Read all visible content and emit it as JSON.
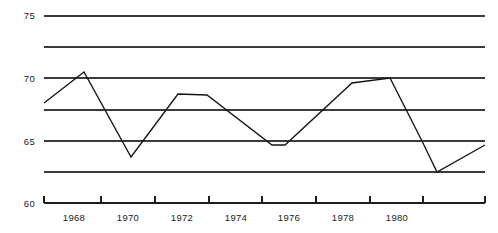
{
  "chart_data": {
    "type": "line",
    "title": "",
    "subtitle": "",
    "xlabel": "",
    "ylabel": "",
    "xlim": [
      1966.6,
      1974.8
    ],
    "ylim": [
      60,
      76
    ],
    "grid": true,
    "legend": null,
    "y_axis": {
      "labels": [
        "75",
        "70",
        "65",
        "60"
      ],
      "label_values": [
        75,
        70,
        65,
        60
      ],
      "gridline_values": [
        75,
        72.5,
        70,
        67.5,
        65,
        62.5
      ],
      "axis_base_value": 60
    },
    "x_axis": {
      "tick_labels": [
        "1968",
        "1970",
        "1972",
        "1974",
        "1976",
        "1978",
        "1980"
      ],
      "tick_label_values": [
        1968,
        1970,
        1972,
        1974,
        1976,
        1978,
        1980
      ],
      "tick_mark_values": [
        1967,
        1969,
        1971,
        1973,
        1975,
        1977,
        1979
      ],
      "range_start": 1966.6,
      "range_end": 1974.8
    },
    "series": [
      {
        "name": "series-1",
        "x": [
          1966.6,
          1967.35,
          1968.25,
          1969.15,
          1970.2,
          1970.9,
          1971.45,
          1972.15,
          1972.8,
          1973.4,
          1974.1,
          1974.8
        ],
        "values": [
          67.8,
          70.5,
          63.9,
          68.6,
          64.6,
          64.6,
          70.0,
          69.7,
          70.0,
          62.5,
          62.5,
          64.6
        ]
      }
    ],
    "points": [
      {
        "year": 1966.6,
        "value": 67.8
      },
      {
        "year": 1967.35,
        "value": 70.5
      },
      {
        "year": 1968.25,
        "value": 63.9
      },
      {
        "year": 1969.15,
        "value": 68.6
      },
      {
        "year": 1970.2,
        "value": 64.6
      },
      {
        "year": 1970.9,
        "value": 64.6
      },
      {
        "year": 1971.45,
        "value": 70.0
      },
      {
        "year": 1972.15,
        "value": 69.7
      },
      {
        "year": 1972.8,
        "value": 70.0
      },
      {
        "year": 1973.4,
        "value": 62.5
      },
      {
        "year": 1974.1,
        "value": 62.5
      },
      {
        "year": 1974.8,
        "value": 64.6
      }
    ],
    "pixel_polyline": [
      [
        44,
        103
      ],
      [
        84,
        72
      ],
      [
        131,
        157
      ],
      [
        178,
        94
      ],
      [
        207,
        95
      ],
      [
        272,
        145
      ],
      [
        285,
        145
      ],
      [
        352,
        83
      ],
      [
        390,
        78
      ],
      [
        422,
        141
      ],
      [
        437,
        172
      ],
      [
        485,
        145
      ]
    ],
    "geometry": {
      "plot_left": 44,
      "plot_right": 485,
      "plot_top": 16,
      "plot_bottom": 203,
      "gridline_y_px": [
        16,
        47,
        78,
        110,
        141,
        172
      ],
      "axis_y_px": 203,
      "tick_x_px": [
        101,
        155,
        209,
        262,
        316,
        370,
        423
      ],
      "tick_label_x_px": [
        74,
        128,
        182,
        236,
        289,
        343,
        397
      ],
      "tick_label_y_px": 221,
      "y_label_x_px": 35,
      "y_label_y_px": [
        19,
        82,
        145,
        207
      ],
      "tick_len_px": 7
    }
  }
}
